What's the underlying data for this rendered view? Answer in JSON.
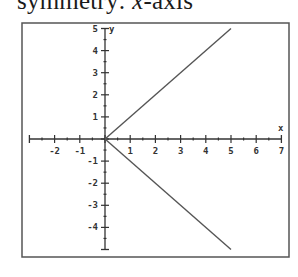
{
  "caption": {
    "prefix": "symmetry: ",
    "variable": "x",
    "suffix": "-axis"
  },
  "chart_data": {
    "type": "line",
    "title": "",
    "xlabel": "x",
    "ylabel": "y",
    "xlim": [
      -3,
      7
    ],
    "ylim": [
      -5,
      5
    ],
    "x_ticks": [
      -2,
      -1,
      1,
      2,
      3,
      4,
      5,
      6,
      7
    ],
    "y_ticks": [
      5,
      4,
      3,
      2,
      1,
      -1,
      -2,
      -3,
      -4
    ],
    "minor_ticks_step": 0.5,
    "grid": false,
    "legend": null,
    "series": [
      {
        "name": "upper branch (y = x)",
        "x": [
          0,
          5
        ],
        "y": [
          0,
          5
        ]
      },
      {
        "name": "lower branch (y = -x)",
        "x": [
          0,
          5
        ],
        "y": [
          0,
          -5
        ]
      }
    ],
    "relation": "x = |y|",
    "colors": {
      "axes": "#333333",
      "lines": "#555555",
      "frame": "#555555"
    }
  }
}
